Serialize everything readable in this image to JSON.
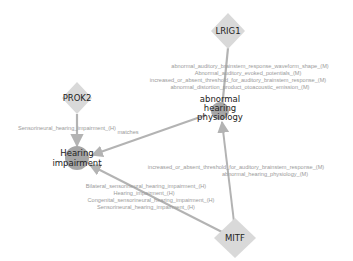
{
  "graph": {
    "colors": {
      "gene_node": "#d9d9d9",
      "phenotype_node": "#a6a6a6",
      "edge": "#b3b3b3",
      "edge_label": "#9a9a9a",
      "node_label": "#222222"
    },
    "nodes": [
      {
        "id": "LRIG1",
        "label": "LRIG1",
        "shape": "diamond",
        "x": 228,
        "y": 31
      },
      {
        "id": "PROK2",
        "label": "PROK2",
        "shape": "diamond",
        "x": 77,
        "y": 98
      },
      {
        "id": "MITF",
        "label": "MITF",
        "shape": "diamond",
        "x": 235,
        "y": 238
      },
      {
        "id": "abnormal_hearing_physiology",
        "label_lines": [
          "abnormal",
          "hearing",
          "physiology"
        ],
        "shape": "circle",
        "x": 220,
        "y": 109
      },
      {
        "id": "hearing_impairment",
        "label_lines": [
          "Hearing",
          "impairment"
        ],
        "shape": "circle",
        "x": 77,
        "y": 158
      }
    ],
    "edge_label_groups": {
      "lrig1_to_ahp": [
        "abnormal_auditory_brainstem_response_waveform_shape_(M)",
        "Abnormal_auditory_evoked_potentials_(M)",
        "increased_or_absent_threshold_for_auditory_brainstem_response_(M)",
        "abnormal_distortion_product_otoacoustic_emission_(M)"
      ],
      "prok2_to_hi": [
        "Sensorineural_hearing_impairment_(H)"
      ],
      "ahp_to_hi": [
        "matches"
      ],
      "mitf_to_ahp": [
        "increased_or_absent_threshold_for_auditory_brainstem_response_(M)",
        "abnormal_hearing_physiology_(M)"
      ],
      "mitf_to_hi": [
        "Bilateral_sensorineural_hearing_impairment_(H)",
        "Hearing_impairment_(H)",
        "Congenital_sensorineural_hearing_impairment_(H)",
        "Sensorineural_hearing_impairment_(H)"
      ]
    }
  }
}
